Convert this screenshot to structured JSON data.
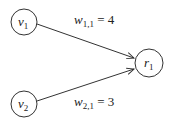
{
  "diagram": {
    "nodes": [
      {
        "id": "v1",
        "base": "v",
        "sub": "1",
        "cx": 24,
        "cy": 22,
        "r": 13
      },
      {
        "id": "v2",
        "base": "v",
        "sub": "2",
        "cx": 24,
        "cy": 104,
        "r": 13
      },
      {
        "id": "r1",
        "base": "r",
        "sub": "1",
        "cx": 149,
        "cy": 63,
        "r": 14
      }
    ],
    "edges": [
      {
        "from": "v1",
        "to": "r1",
        "label_base": "w",
        "label_sub": "1,1",
        "label_eq": " = 4"
      },
      {
        "from": "v2",
        "to": "r1",
        "label_base": "w",
        "label_sub": "2,1",
        "label_eq": " = 3"
      }
    ],
    "colors": {
      "stroke": "#333333",
      "text": "#222222",
      "background": "#ffffff"
    }
  }
}
